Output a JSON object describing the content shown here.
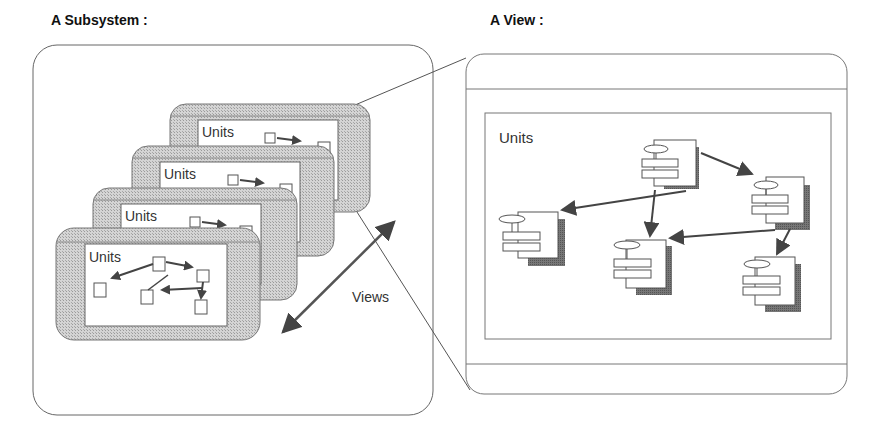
{
  "titles": {
    "subsystem": "A Subsystem :",
    "view": "A View :"
  },
  "subsystem": {
    "stack_labels": [
      "Units",
      "Units",
      "Units",
      "Units"
    ]
  },
  "views_label": "Views",
  "view": {
    "units_label": "Units"
  },
  "colors": {
    "line": "#555555",
    "hatch": "#bdbdbd",
    "shadow": "#6e6e6e",
    "arrow": "#444444"
  }
}
